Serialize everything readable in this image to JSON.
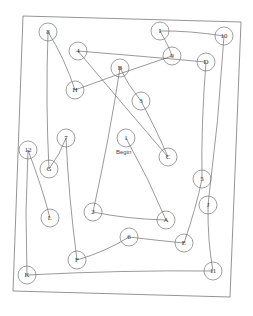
{
  "document": {
    "type": "Trail Making Test (Part B) worksheet",
    "start_label": "Begin",
    "nodes": [
      {
        "label": "1",
        "x": 126,
        "y": 138
      },
      {
        "label": "A",
        "x": 166,
        "y": 220
      },
      {
        "label": "2",
        "x": 93,
        "y": 212
      },
      {
        "label": "B",
        "x": 120,
        "y": 68
      },
      {
        "label": "3",
        "x": 141,
        "y": 101
      },
      {
        "label": "C",
        "x": 168,
        "y": 157
      },
      {
        "label": "4",
        "x": 78,
        "y": 51
      },
      {
        "label": "D",
        "x": 206,
        "y": 62
      },
      {
        "label": "5",
        "x": 202,
        "y": 179
      },
      {
        "label": "E",
        "x": 184,
        "y": 243
      },
      {
        "label": "6",
        "x": 129,
        "y": 237
      },
      {
        "label": "F",
        "x": 77,
        "y": 260
      },
      {
        "label": "7",
        "x": 66,
        "y": 138
      },
      {
        "label": "G",
        "x": 49,
        "y": 169
      },
      {
        "label": "8",
        "x": 48,
        "y": 32
      },
      {
        "label": "H",
        "x": 75,
        "y": 90
      },
      {
        "label": "9",
        "x": 172,
        "y": 56
      },
      {
        "label": "I",
        "x": 160,
        "y": 31
      },
      {
        "label": "10",
        "x": 224,
        "y": 36
      },
      {
        "label": "J",
        "x": 208,
        "y": 205
      },
      {
        "label": "11",
        "x": 213,
        "y": 271
      },
      {
        "label": "K",
        "x": 27,
        "y": 275
      },
      {
        "label": "12",
        "x": 28,
        "y": 150
      },
      {
        "label": "L",
        "x": 50,
        "y": 218
      }
    ]
  }
}
